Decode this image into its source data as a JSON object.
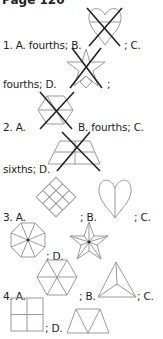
{
  "heading": "Page 120",
  "lines": {
    "q1a": "1. A. fourths; B.",
    "q1c": "; C.",
    "q1d": "fourths; D.",
    "q1end": ";",
    "q2a": "2. A.",
    "q2b": "B. fourths; C.",
    "q2d": "sixths; D.",
    "q3a": "3. A.",
    "q3b": "; B.",
    "q3c": "; C.",
    "q3d": "; D.",
    "q4a": "4. A.",
    "q4b": "; B.",
    "q4c": "; C.",
    "q4d": "; D."
  },
  "figures": {
    "q1b": {
      "shape": "heart-divided-horizontal",
      "crossed": true
    },
    "q1d": {
      "shape": "star",
      "crossed": true
    },
    "q2a": {
      "shape": "hexagon-divided",
      "crossed": true
    },
    "q2d": {
      "shape": "trapezoid-divided",
      "crossed": true
    },
    "q3a": {
      "shape": "diamond-grid-3x3",
      "crossed": false
    },
    "q3b": {
      "shape": "heart-halves",
      "crossed": false
    },
    "q3c": {
      "shape": "octagon-eighths",
      "crossed": false
    },
    "q3d": {
      "shape": "star-tenths",
      "crossed": false
    },
    "q4a": {
      "shape": "hexagon-sixths",
      "crossed": false
    },
    "q4b": {
      "shape": "triangle-thirds",
      "crossed": false
    },
    "q4c": {
      "shape": "square-fourths",
      "crossed": false
    },
    "q4d": {
      "shape": "trapezoid-thirds",
      "crossed": false
    }
  },
  "colors": {
    "ink": "#222222",
    "figure": "#9a9a9a",
    "background": "#ffffff"
  }
}
